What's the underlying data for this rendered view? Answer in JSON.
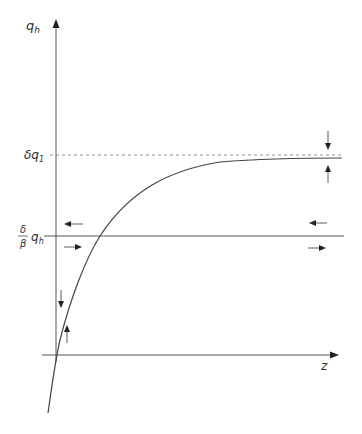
{
  "diagram": {
    "y_axis_label": "q",
    "y_axis_label_sub": "h",
    "x_axis_label": "z",
    "upper_level_label_prefix": "δq",
    "upper_level_label_sub": "1",
    "ratio_numerator": "δ",
    "ratio_denominator": "β",
    "ratio_label_var": "q",
    "ratio_label_sub": "h",
    "colors": {
      "axis": "#555555",
      "curve": "#444444",
      "dashed": "#777777",
      "arrow": "#222222"
    },
    "elements": {
      "y_axis": {
        "x": 56,
        "y_top": 20,
        "y_bottom": 362
      },
      "x_axis": {
        "y": 355,
        "x_left": 42,
        "x_right": 335
      },
      "dashed_line": {
        "y": 155,
        "x_left": 50,
        "x_right": 342
      },
      "horizontal_line": {
        "y": 236,
        "x_left": 44,
        "x_right": 344
      },
      "curve": "exponential approach from below to asymptote near δq1"
    }
  }
}
